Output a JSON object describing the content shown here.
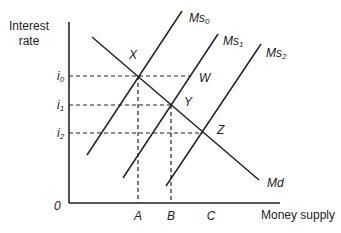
{
  "diagram": {
    "type": "money-market-supply-demand",
    "y_axis_label_line1": "Interest",
    "y_axis_label_line2": "rate",
    "x_axis_label": "Money supply",
    "origin_label": "0",
    "rate_levels": [
      {
        "label": "i",
        "sub": "0",
        "y": 76
      },
      {
        "label": "i",
        "sub": "1",
        "y": 105
      },
      {
        "label": "i",
        "sub": "2",
        "y": 133
      }
    ],
    "quantity_levels": [
      {
        "label": "A",
        "x": 138
      },
      {
        "label": "B",
        "x": 171
      },
      {
        "label": "C",
        "x": 203
      }
    ],
    "curves": {
      "ms0": {
        "label": "Ms",
        "sub": "0"
      },
      "ms1": {
        "label": "Ms",
        "sub": "1"
      },
      "ms2": {
        "label": "Ms",
        "sub": "2"
      },
      "md": {
        "label": "Md"
      }
    },
    "points": {
      "x": "X",
      "y": "Y",
      "z": "Z",
      "w": "W"
    },
    "colors": {
      "line": "#222222",
      "background": "#ffffff"
    }
  }
}
